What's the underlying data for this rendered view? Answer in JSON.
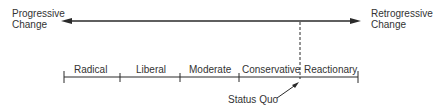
{
  "left_end": {
    "line1": "Progressive",
    "line2": "Change"
  },
  "right_end": {
    "line1": "Retrogressive",
    "line2": "Change"
  },
  "segments": [
    {
      "label": "Radical"
    },
    {
      "label": "Liberal"
    },
    {
      "label": "Moderate"
    },
    {
      "label": "Conservative"
    },
    {
      "label": "Reactionary"
    }
  ],
  "marker": {
    "label": "Status Quo"
  },
  "colors": {
    "line": "#2a2a2a",
    "text": "#333333"
  }
}
